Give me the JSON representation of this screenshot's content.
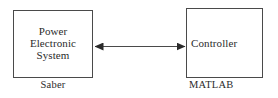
{
  "diagram": {
    "type": "block-diagram",
    "background_color": "#ffffff",
    "stroke_color": "#4a4a4a",
    "text_color": "#2b2b2b",
    "nodes": [
      {
        "id": "power-electronic-system",
        "label": "Power\nElectronic\nSystem",
        "caption": "Saber",
        "position": "left"
      },
      {
        "id": "controller",
        "label": "Controller",
        "caption": "MATLAB",
        "position": "right"
      }
    ],
    "connector": {
      "id": "bidirectional-arrow",
      "from": "power-electronic-system",
      "to": "controller",
      "direction": "bidirectional",
      "style": "solid",
      "color": "#4a4a4a"
    }
  }
}
